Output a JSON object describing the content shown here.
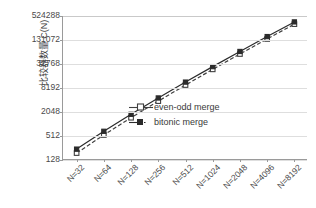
{
  "chart_data": {
    "type": "line",
    "title": "",
    "xlabel": "",
    "ylabel": "比较器数量 C(N)",
    "categories": [
      "N=32",
      "N=64",
      "N=128",
      "N=256",
      "N=512",
      "N=1024",
      "N=2048",
      "N=4096",
      "N=8192"
    ],
    "x_values": [
      32,
      64,
      128,
      256,
      512,
      1024,
      2048,
      4096,
      8192
    ],
    "yscale": "log4",
    "ylim": [
      128,
      524288
    ],
    "yticks": [
      128,
      512,
      2048,
      8192,
      32768,
      131072,
      524288
    ],
    "ytick_labels": [
      "128",
      "512",
      "2048",
      "8192",
      "32768",
      "131072",
      "524288"
    ],
    "grid": true,
    "legend_position": "inside-lower-right",
    "series": [
      {
        "name": "even-odd merge",
        "marker": "open-square",
        "linestyle": "dashed",
        "color": "#404040",
        "values": [
          191,
          543,
          1471,
          3839,
          9727,
          24063,
          58367,
          139263,
          327679
        ]
      },
      {
        "name": "bitonic merge",
        "marker": "filled-square",
        "linestyle": "solid",
        "color": "#2b2b2b",
        "values": [
          240,
          672,
          1792,
          4608,
          11520,
          28160,
          67584,
          159744,
          372736
        ]
      }
    ]
  },
  "axis": {
    "y_title": "比较器数量 C(N)"
  },
  "legend": {
    "items": [
      {
        "label": "even-odd merge"
      },
      {
        "label": "bitonic merge"
      }
    ]
  }
}
